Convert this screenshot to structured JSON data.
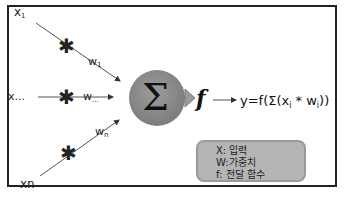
{
  "diagram": {
    "inputs": [
      {
        "label": "x",
        "subscript": "1",
        "weight": "w",
        "weight_sub": "1"
      },
      {
        "label": "x...",
        "subscript": "",
        "weight": "w",
        "weight_sub": "..."
      },
      {
        "label": "xn",
        "subscript": "",
        "weight": "w",
        "weight_sub": "n"
      }
    ],
    "multiply_symbol": "✱",
    "sum_symbol": "Σ",
    "activation_symbol": "f",
    "formula": {
      "prefix": "y=f(Σ(x",
      "sub1": "i",
      "mid": " * w",
      "sub2": "i",
      "suffix": "))"
    },
    "legend": {
      "items": [
        "X: 입력",
        "W:가중치",
        "f: 전달 함수"
      ]
    },
    "colors": {
      "sum_node": "#8f8f8f",
      "legend_bg": "#b5b5b5",
      "arrow": "#444444"
    }
  }
}
